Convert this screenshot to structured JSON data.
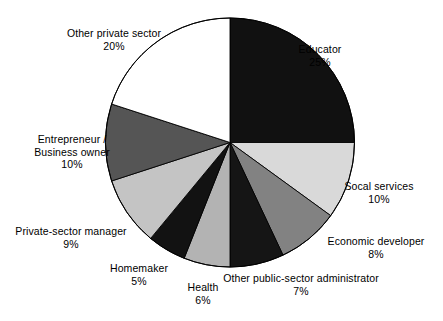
{
  "chart_data": {
    "type": "pie",
    "title": "",
    "subtitle": "",
    "xlabel": "",
    "ylabel": "",
    "legend_position": "none",
    "grid": false,
    "units": "percent",
    "start_angle_deg": 0,
    "direction": "clockwise",
    "total": 100,
    "categories": [
      "Educator",
      "Socal services",
      "Economic developer",
      "Other public-sector administrator",
      "Health",
      "Homemaker",
      "Private-sector manager",
      "Entrepreneur / Business owner",
      "Other private sector"
    ],
    "values": [
      25,
      10,
      8,
      7,
      6,
      5,
      9,
      10,
      20
    ],
    "value_labels": [
      "25%",
      "10%",
      "8%",
      "7%",
      "6%",
      "5%",
      "9%",
      "10%",
      "20%"
    ],
    "colors": [
      "#111111",
      "#d9d9d9",
      "#828282",
      "#151515",
      "#b3b3b3",
      "#121212",
      "#c4c4c4",
      "#555555",
      "#ffffff"
    ],
    "slices": [
      {
        "label": "Educator",
        "label_lines": [
          "Educator"
        ],
        "value": 25,
        "value_label": "25%",
        "color": "#111111"
      },
      {
        "label": "Socal services",
        "label_lines": [
          "Socal services"
        ],
        "value": 10,
        "value_label": "10%",
        "color": "#d9d9d9"
      },
      {
        "label": "Economic developer",
        "label_lines": [
          "Economic developer"
        ],
        "value": 8,
        "value_label": "8%",
        "color": "#828282"
      },
      {
        "label": "Other public-sector administrator",
        "label_lines": [
          "Other public-sector administrator"
        ],
        "value": 7,
        "value_label": "7%",
        "color": "#151515"
      },
      {
        "label": "Health",
        "label_lines": [
          "Health"
        ],
        "value": 6,
        "value_label": "6%",
        "color": "#b3b3b3"
      },
      {
        "label": "Homemaker",
        "label_lines": [
          "Homemaker"
        ],
        "value": 5,
        "value_label": "5%",
        "color": "#121212"
      },
      {
        "label": "Private-sector manager",
        "label_lines": [
          "Private-sector manager"
        ],
        "value": 9,
        "value_label": "9%",
        "color": "#c4c4c4"
      },
      {
        "label": "Entrepreneur / Business owner",
        "label_lines": [
          "Entrepreneur /",
          "Business owner"
        ],
        "value": 10,
        "value_label": "10%",
        "color": "#555555"
      },
      {
        "label": "Other private sector",
        "label_lines": [
          "Other private sector"
        ],
        "value": 20,
        "value_label": "20%",
        "color": "#ffffff"
      }
    ]
  },
  "labels": {
    "educator": {
      "line1": "Educator",
      "value": "25%"
    },
    "social_services": {
      "line1": "Socal services",
      "value": "10%"
    },
    "economic_developer": {
      "line1": "Economic developer",
      "value": "8%"
    },
    "public_sector_admin": {
      "line1": "Other public-sector administrator",
      "value": "7%"
    },
    "health": {
      "line1": "Health",
      "value": "6%"
    },
    "homemaker": {
      "line1": "Homemaker",
      "value": "5%"
    },
    "private_sector_manager": {
      "line1": "Private-sector manager",
      "value": "9%"
    },
    "entrepreneur": {
      "line1": "Entrepreneur /",
      "line2": "Business owner",
      "value": "10%"
    },
    "other_private_sector": {
      "line1": "Other private sector",
      "value": "20%"
    }
  },
  "style": {
    "outline_color": "#000000",
    "background": "#ffffff"
  }
}
